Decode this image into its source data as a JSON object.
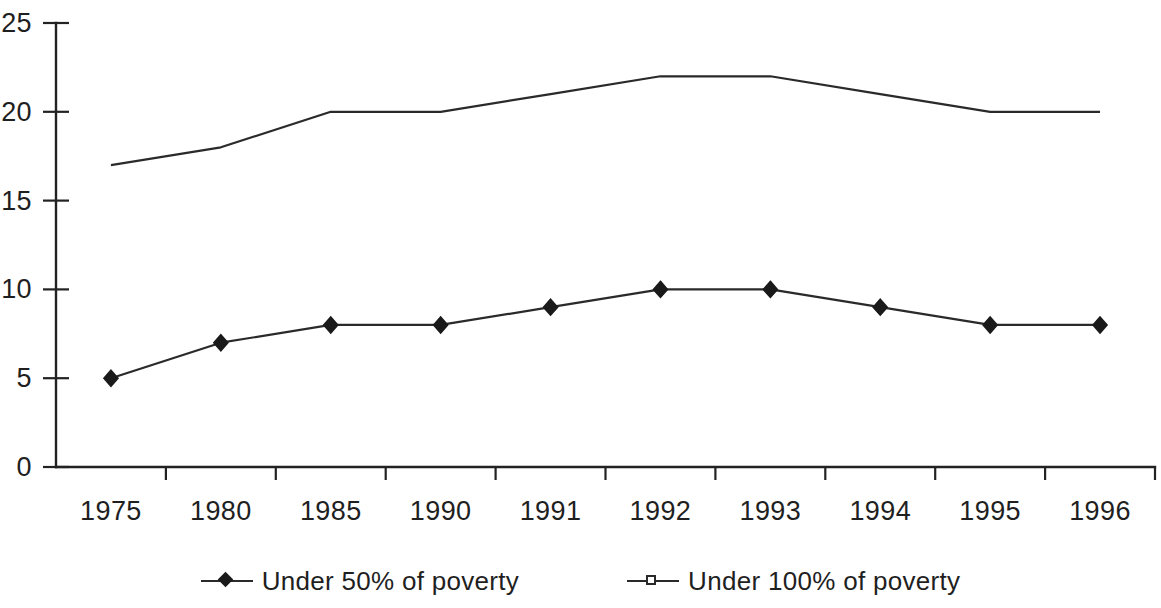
{
  "chart_data": {
    "type": "line",
    "title": "",
    "subtitle": "",
    "xlabel": "",
    "ylabel": "",
    "categories": [
      "1975",
      "1980",
      "1985",
      "1990",
      "1991",
      "1992",
      "1993",
      "1994",
      "1995",
      "1996"
    ],
    "series": [
      {
        "name": "Under 50% of poverty",
        "marker": "filled-diamond",
        "color": "#1a1a1a",
        "values": [
          5,
          7,
          8,
          8,
          9,
          10,
          10,
          9,
          8,
          8
        ]
      },
      {
        "name": "Under 100% of poverty",
        "marker": "open-square",
        "color": "#2a2a2a",
        "values": [
          17,
          18,
          20,
          20,
          21,
          22,
          22,
          21,
          20,
          20
        ]
      }
    ],
    "ylim": [
      0,
      25
    ],
    "yticks": [
      0,
      5,
      10,
      15,
      20,
      25
    ],
    "ytick_labels": [
      "0",
      "5",
      "10",
      "15",
      "20",
      "25"
    ],
    "grid": false,
    "legend_position": "bottom-center"
  },
  "legend": {
    "entries": [
      {
        "label": "Under 50% of poverty",
        "marker": "filled-diamond-icon"
      },
      {
        "label": "Under 100% of poverty",
        "marker": "open-square-icon"
      }
    ]
  }
}
